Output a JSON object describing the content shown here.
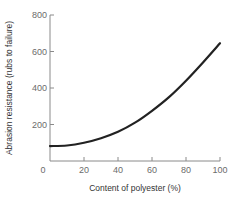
{
  "chart_data": {
    "type": "line",
    "title": "",
    "xlabel": "Content of polyester (%)",
    "ylabel": "Abrasion resistance (rubs to failure)",
    "xlim": [
      0,
      100
    ],
    "ylim": [
      0,
      800
    ],
    "x_ticks": [
      "0",
      "20",
      "40",
      "60",
      "80",
      "100"
    ],
    "y_ticks": [
      "200",
      "400",
      "600",
      "800"
    ],
    "grid": false,
    "legend": null,
    "series": [
      {
        "name": "Abrasion resistance",
        "color": "#222222",
        "x": [
          0,
          10,
          20,
          30,
          40,
          50,
          60,
          70,
          80,
          90,
          100
        ],
        "values": [
          82,
          85,
          100,
          125,
          160,
          210,
          275,
          350,
          440,
          540,
          645
        ]
      }
    ]
  },
  "colors": {
    "axis": "#8a8a8a",
    "line": "#222222",
    "text": "#6b6b6b"
  }
}
